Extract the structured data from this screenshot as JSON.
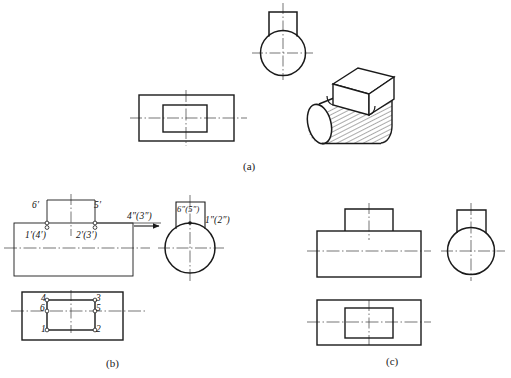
{
  "figure": {
    "title_captions": [
      {
        "id": "cap-a",
        "text": "(a)",
        "x": 243,
        "y": 160
      },
      {
        "id": "cap-b",
        "text": "(b)",
        "x": 106,
        "y": 357
      },
      {
        "id": "cap-c",
        "text": "(c)",
        "x": 386,
        "y": 355
      }
    ],
    "stroke_color": "#1a1a1a",
    "center_line_color": "#3a3a3a",
    "hatch_color": "#2a2a2a",
    "background": "#ffffff"
  },
  "panel_a": {
    "name": "panel-a",
    "top_view": {
      "label": "rectangular top view with inner rectangle"
    },
    "side_view": {
      "label": "circle with square boss on top"
    },
    "pictorial": {
      "label": "isometric hatched cylinder with rectangular block"
    }
  },
  "panel_b": {
    "name": "panel-b",
    "front_view_labels": [
      {
        "id": "b-6p",
        "text": "6′",
        "x": 32,
        "y": 207
      },
      {
        "id": "b-5p",
        "text": "5′",
        "x": 94,
        "y": 207
      },
      {
        "id": "b-14p",
        "text": "1′(4′)",
        "x": 27,
        "y": 231
      },
      {
        "id": "b-23p",
        "text": "2′(3′)",
        "x": 80,
        "y": 231
      }
    ],
    "side_view_labels": [
      {
        "id": "b-43pp",
        "text": "4″(3″)",
        "x": 127,
        "y": 212
      },
      {
        "id": "b-65pp",
        "text": "6″(5″)",
        "x": 168,
        "y": 203
      },
      {
        "id": "b-12pp",
        "text": "1″(2″)",
        "x": 199,
        "y": 215
      }
    ],
    "top_view_labels": [
      {
        "id": "b-4",
        "text": "4",
        "x": 44,
        "y": 296
      },
      {
        "id": "b-3",
        "text": "3",
        "x": 95,
        "y": 296
      },
      {
        "id": "b-6",
        "text": "6",
        "x": 43,
        "y": 310
      },
      {
        "id": "b-5",
        "text": "5",
        "x": 95,
        "y": 310
      },
      {
        "id": "b-1",
        "text": "1",
        "x": 44,
        "y": 326
      },
      {
        "id": "b-2",
        "text": "2",
        "x": 95,
        "y": 326
      }
    ],
    "projection_arrow": {
      "direction": "right",
      "label": "projection-direction-arrow"
    }
  },
  "panel_c": {
    "name": "panel-c",
    "front_view": {
      "label": "stepped front view with raised boss"
    },
    "side_view": {
      "label": "circle with square boss on top"
    },
    "top_view": {
      "label": "rectangle with inner rectangle"
    }
  }
}
